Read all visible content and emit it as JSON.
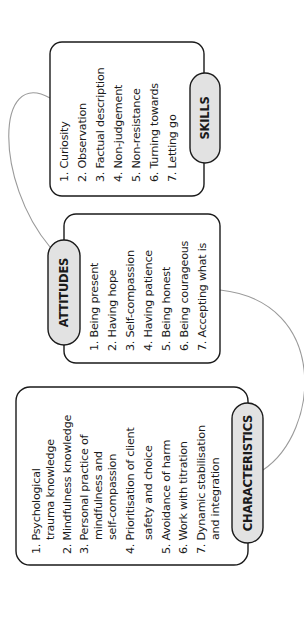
{
  "diagram": {
    "orientation": "rotated 90 degrees counter-clockwise",
    "colors": {
      "box_stroke": "#1a1a1a",
      "pill_fill": "#e2e2e2",
      "connector": "#9a9a9a",
      "text": "#1a1a1a"
    },
    "sections": {
      "skills": {
        "title": "SKILLS",
        "items": [
          "1. Curiosity",
          "2. Observation",
          "3. Factual description",
          "4. Non-judgement",
          "5. Non-resistance",
          "6. Turning towards",
          "7. Letting go"
        ]
      },
      "attitudes": {
        "title": "ATTITUDES",
        "items": [
          "1. Being present",
          "2. Having hope",
          "3. Self-compassion",
          "4. Having patience",
          "5. Being honest",
          "6. Being courageous",
          "7. Accepting what is"
        ]
      },
      "characteristics": {
        "title": "CHARACTERISTICS",
        "lines": [
          "1. Psychological",
          "trauma knowledge",
          "2. Mindfulness knowledge",
          "3. Personal practice of",
          "mindfulness and",
          "self-compassion",
          "4. Prioritisation of client",
          "safety and choice",
          "5. Avoidance of harm",
          "6. Work with titration",
          "7. Dynamic stabilisation",
          "and integration"
        ]
      }
    }
  }
}
